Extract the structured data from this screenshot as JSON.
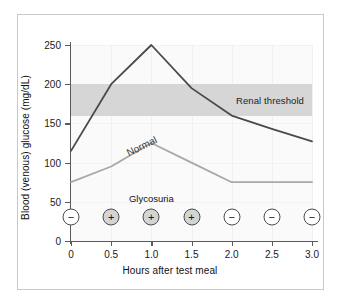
{
  "figure": {
    "background_color": "#ffffff",
    "frame_color": "#c9c9c9",
    "plot_background_color": "#fafafa"
  },
  "chart_data": {
    "type": "line",
    "title": "",
    "xlabel": "Hours after test meal",
    "ylabel": "Blood (venous) glucose (mg/dL)",
    "x": [
      0,
      0.5,
      1.0,
      1.5,
      2.0,
      2.5,
      3.0
    ],
    "xtick_labels": [
      "0",
      "0.5",
      "1.0",
      "1.5",
      "2.0",
      "2.5",
      "3.0"
    ],
    "ytick_labels": [
      "0",
      "50",
      "100",
      "150",
      "200",
      "250"
    ],
    "yticks": [
      0,
      50,
      100,
      150,
      200,
      250
    ],
    "xlim": [
      0,
      3.0
    ],
    "ylim": [
      0,
      250
    ],
    "grid": true,
    "legend_position": "inline-annotation",
    "series": [
      {
        "name": "Diabetic",
        "label": "",
        "color": "#4a4a4a",
        "width": 1.8,
        "values": [
          115,
          200,
          250,
          195,
          160,
          143,
          127
        ]
      },
      {
        "name": "Normal",
        "label": "Normal",
        "color": "#a8a8a8",
        "width": 1.8,
        "values": [
          75,
          95,
          125,
          100,
          75,
          75,
          75
        ]
      }
    ],
    "bands": [
      {
        "name": "renal-threshold",
        "label": "Renal threshold",
        "from": 160,
        "to": 200,
        "color": "#d6d6d6"
      }
    ],
    "annotations": [
      {
        "name": "normal-curve-label",
        "text": "Normal",
        "x": 0.72,
        "y": 108,
        "rotation": -26,
        "color": "#3a3a3a"
      },
      {
        "name": "glycosuria-title",
        "text": "Glycosuria",
        "x": 1.0,
        "y": 48,
        "color": "#111111"
      }
    ],
    "glycosuria": {
      "title": "Glycosuria",
      "markers": [
        {
          "x": 0,
          "sign": "−",
          "positive": false
        },
        {
          "x": 0.5,
          "sign": "+",
          "positive": true
        },
        {
          "x": 1.0,
          "sign": "+",
          "positive": true
        },
        {
          "x": 1.5,
          "sign": "+",
          "positive": true
        },
        {
          "x": 2.0,
          "sign": "−",
          "positive": false
        },
        {
          "x": 2.5,
          "sign": "−",
          "positive": false
        },
        {
          "x": 3.0,
          "sign": "−",
          "positive": false
        }
      ]
    }
  }
}
